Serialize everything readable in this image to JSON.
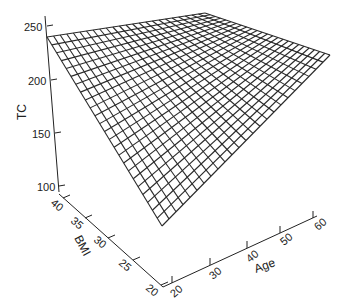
{
  "chart_data": {
    "type": "surface3d",
    "title": "",
    "zlabel": "TC",
    "xlabel": "Age",
    "ylabel": "BMI",
    "z_ticks": [
      "100",
      "150",
      "200",
      "250"
    ],
    "x_ticks": [
      "20",
      "30",
      "40",
      "50",
      "60"
    ],
    "y_ticks": [
      "20",
      "25",
      "30",
      "35",
      "40"
    ],
    "xlim": [
      20,
      60
    ],
    "ylim": [
      20,
      40
    ],
    "zlim": [
      100,
      250
    ],
    "grid_lines": 25,
    "surface_corners": [
      {
        "age": 20,
        "bmi": 40,
        "tc": 240
      },
      {
        "age": 60,
        "bmi": 40,
        "tc": 250
      },
      {
        "age": 60,
        "bmi": 20,
        "tc": 232
      },
      {
        "age": 20,
        "bmi": 20,
        "tc": 120
      }
    ],
    "line_color": "#2a2a2a"
  }
}
